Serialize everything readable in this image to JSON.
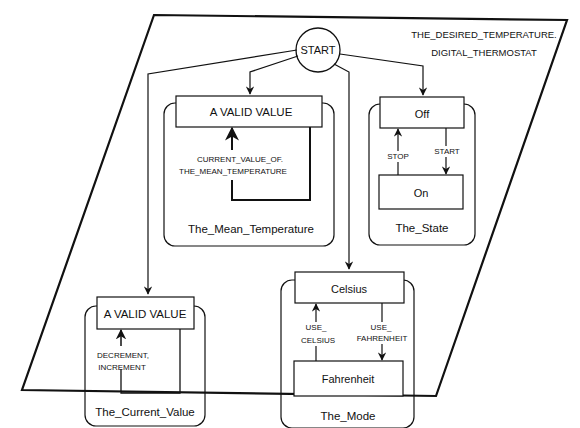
{
  "diagram": {
    "type": "statechart",
    "title_line1": "THE_DESIRED_TEMPERATURE.",
    "title_line2": "DIGITAL_THERMOSTAT",
    "start_label": "START",
    "regions": [
      {
        "name": "The_Mean_Temperature",
        "states": [
          "A VALID VALUE"
        ],
        "transitions": [
          {
            "label_line1": "CURRENT_VALUE_OF.",
            "label_line2": "THE_MEAN_TEMPERATURE",
            "from": "A VALID VALUE",
            "to": "A VALID VALUE"
          }
        ]
      },
      {
        "name": "The_State",
        "states": [
          "Off",
          "On"
        ],
        "transitions": [
          {
            "label": "STOP",
            "from": "On",
            "to": "Off"
          },
          {
            "label": "START",
            "from": "Off",
            "to": "On"
          }
        ]
      },
      {
        "name": "The_Current_Value",
        "states": [
          "A VALID VALUE"
        ],
        "transitions": [
          {
            "label_line1": "DECREMENT,",
            "label_line2": "INCREMENT",
            "from": "A VALID VALUE",
            "to": "A VALID VALUE"
          }
        ]
      },
      {
        "name": "The_Mode",
        "states": [
          "Celsius",
          "Fahrenheit"
        ],
        "transitions": [
          {
            "label_line1": "USE_",
            "label_line2": "CELSIUS",
            "from": "Fahrenheit",
            "to": "Celsius"
          },
          {
            "label_line1": "USE_",
            "label_line2": "FAHRENHEIT",
            "from": "Celsius",
            "to": "Fahrenheit"
          }
        ]
      }
    ]
  },
  "colors": {
    "stroke": "#111111",
    "background": "#ffffff"
  }
}
